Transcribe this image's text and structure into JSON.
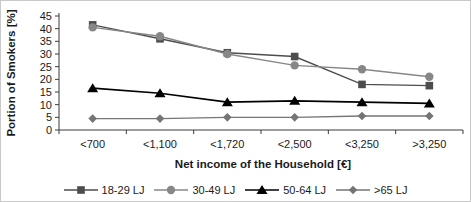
{
  "chart_data": {
    "type": "line",
    "title": "",
    "xlabel": "Net income of the Household [€]",
    "ylabel": "Portion of Smokers [%]",
    "categories": [
      "<700",
      "<1,100",
      "<1,720",
      "<2,500",
      "<3,250",
      ">3,250"
    ],
    "ylim": [
      0,
      45
    ],
    "ytick_step": 5,
    "grid": false,
    "legend_position": "bottom",
    "series": [
      {
        "name": "18-29 LJ",
        "marker": "square",
        "color": "#4d4d4d",
        "values": [
          41.5,
          36.0,
          30.5,
          29.0,
          18.0,
          17.5
        ]
      },
      {
        "name": "30-49 LJ",
        "marker": "circle",
        "color": "#878787",
        "values": [
          40.5,
          37.0,
          30.0,
          25.5,
          24.0,
          21.0
        ]
      },
      {
        "name": "50-64 LJ",
        "marker": "triangle",
        "color": "#000000",
        "values": [
          16.5,
          14.5,
          11.0,
          11.5,
          11.0,
          10.5
        ]
      },
      {
        "name": ">65 LJ",
        "marker": "diamond",
        "color": "#757575",
        "values": [
          4.5,
          4.5,
          5.0,
          5.0,
          5.5,
          5.5
        ]
      }
    ],
    "axis_color": "#3a3a3a"
  }
}
